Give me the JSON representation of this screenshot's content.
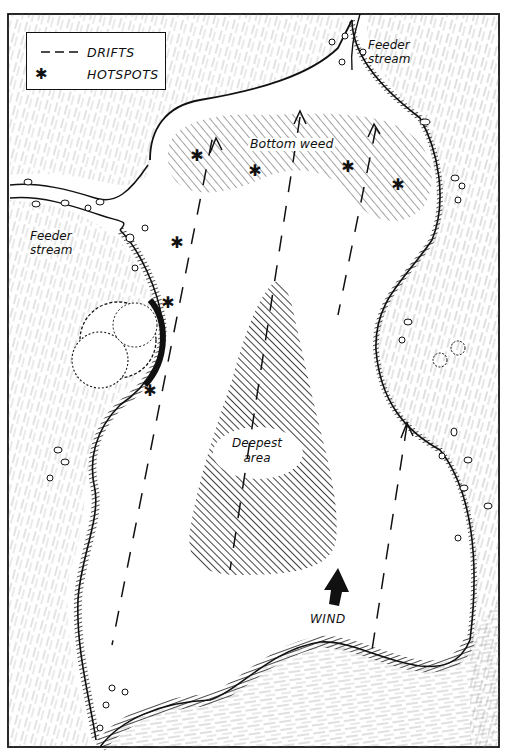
{
  "legend": {
    "items": [
      {
        "symbol": "dashed-line",
        "label": "DRIFTS"
      },
      {
        "symbol": "asterisk",
        "label": "HOTSPOTS"
      }
    ]
  },
  "labels": {
    "feeder_stream_top_right": [
      "Feeder",
      "stream"
    ],
    "feeder_stream_left": [
      "Feeder",
      "stream"
    ],
    "bottom_weed": "Bottom weed",
    "deepest_area": [
      "Deepest",
      "area"
    ],
    "wind": "WIND"
  },
  "map_features": {
    "drift_lines": 4,
    "hotspots": 8,
    "wind_direction": "north",
    "hatched_regions": [
      "Bottom weed",
      "Deepest area"
    ]
  },
  "colors": {
    "ink": "#111111",
    "paper": "#ffffff"
  }
}
